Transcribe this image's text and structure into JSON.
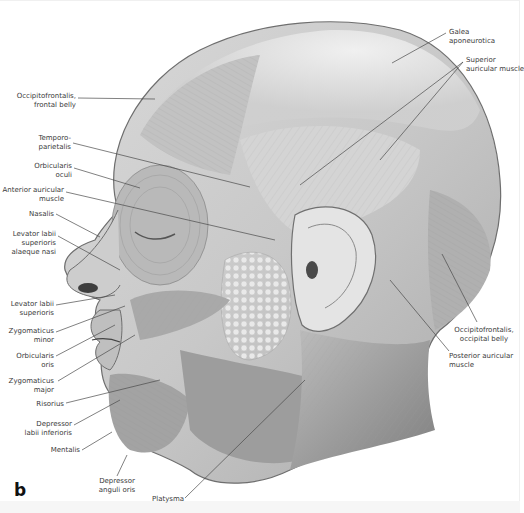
{
  "figure": {
    "panel_letter": "b"
  },
  "labels": {
    "left": [
      {
        "id": "occipitofrontalis-frontal",
        "text": "Occipitofrontalis,\nfrontal belly"
      },
      {
        "id": "temporoparietalis",
        "text": "Temporo-\nparietalis"
      },
      {
        "id": "orbicularis-oculi",
        "text": "Orbicularis\noculi"
      },
      {
        "id": "anterior-auricular",
        "text": "Anterior auricular\nmuscle"
      },
      {
        "id": "nasalis",
        "text": "Nasalis"
      },
      {
        "id": "levator-labii-alaeque",
        "text": "Levator labii\nsuperioris\nalaeque nasi"
      },
      {
        "id": "levator-labii-superioris",
        "text": "Levator labii\nsuperioris"
      },
      {
        "id": "zygomaticus-minor",
        "text": "Zygomaticus\nminor"
      },
      {
        "id": "orbicularis-oris",
        "text": "Orbicularis\noris"
      },
      {
        "id": "zygomaticus-major",
        "text": "Zygomaticus\nmajor"
      },
      {
        "id": "risorius",
        "text": "Risorius"
      },
      {
        "id": "depressor-labii-inferioris",
        "text": "Depressor\nlabii inferioris"
      },
      {
        "id": "mentalis",
        "text": "Mentalis"
      }
    ],
    "bottom": [
      {
        "id": "depressor-anguli-oris",
        "text": "Depressor\nanguli oris"
      },
      {
        "id": "platysma",
        "text": "Platysma"
      }
    ],
    "right": [
      {
        "id": "galea-aponeurotica",
        "text": "Galea\naponeurotica"
      },
      {
        "id": "superior-auricular",
        "text": "Superior\nauricular muscle"
      },
      {
        "id": "occipitofrontalis-occipital",
        "text": "Occipitofrontalis,\noccipital belly"
      },
      {
        "id": "posterior-auricular",
        "text": "Posterior auricular\nmuscle"
      }
    ]
  },
  "colors": {
    "background": "#ffffff",
    "label_text": "#3a3a3a",
    "leader_line": "#4a4a4a",
    "skin_light": "#e2e2e2",
    "muscle_mid": "#b5b5b5",
    "muscle_dark": "#8a8a8a"
  }
}
